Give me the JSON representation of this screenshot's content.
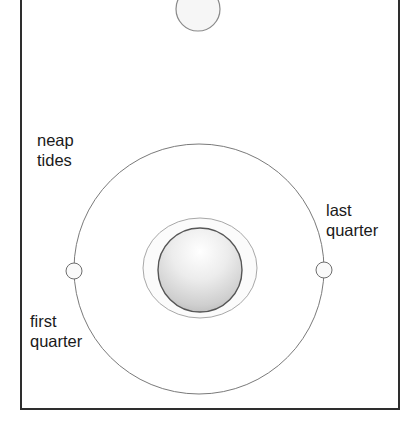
{
  "diagram": {
    "title_context": "Neap tides: Sun, Moon and Earth configuration",
    "labels": {
      "neap_tides": [
        "neap",
        "tides"
      ],
      "last_quarter": [
        "last",
        "quarter"
      ],
      "first_quarter": [
        "first",
        "quarter"
      ]
    },
    "elements": {
      "sun": {
        "cx": 198,
        "cy": 9,
        "r": 22
      },
      "orbit": {
        "cx": 199,
        "cy": 269,
        "r": 125
      },
      "earth": {
        "cx": 200,
        "cy": 270,
        "r": 42
      },
      "tidal_bulge": {
        "cx": 200,
        "cy": 268,
        "rx": 57,
        "ry": 50
      },
      "moon_first_quarter": {
        "cx": 74,
        "cy": 271,
        "r": 8
      },
      "moon_last_quarter": {
        "cx": 324,
        "cy": 270,
        "r": 8
      }
    },
    "colors": {
      "frame": "#2e2e2e",
      "orbit": "#7a7a7a",
      "earth_outline": "#555555",
      "text": "#1a1a1a"
    }
  }
}
